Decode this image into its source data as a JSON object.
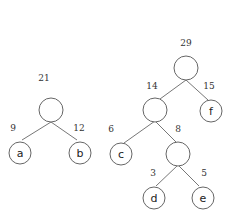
{
  "diagram": {
    "type": "huffman-trees",
    "left_tree": {
      "root_weight": "21",
      "edges": [
        {
          "weight": "9",
          "child": "a"
        },
        {
          "weight": "12",
          "child": "b"
        }
      ],
      "leaves": [
        "a",
        "b"
      ]
    },
    "right_tree": {
      "root_weight": "29",
      "edges": [
        {
          "weight": "14",
          "child": "internal-14"
        },
        {
          "weight": "15",
          "child": "f"
        },
        {
          "weight": "6",
          "child": "c"
        },
        {
          "weight": "8",
          "child": "internal-8"
        },
        {
          "weight": "3",
          "child": "d"
        },
        {
          "weight": "5",
          "child": "e"
        }
      ],
      "leaves": [
        "c",
        "d",
        "e",
        "f"
      ]
    }
  },
  "labels": {
    "l_root": "21",
    "l_w_a": "9",
    "l_w_b": "12",
    "l_a": "a",
    "l_b": "b",
    "r_root": "29",
    "r_w_14": "14",
    "r_w_15": "15",
    "r_w_6": "6",
    "r_w_8": "8",
    "r_w_3": "3",
    "r_w_5": "5",
    "r_c": "c",
    "r_d": "d",
    "r_e": "e",
    "r_f": "f"
  }
}
